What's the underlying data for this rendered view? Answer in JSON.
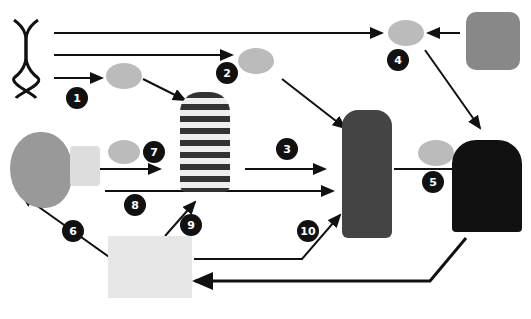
{
  "diagram": {
    "title": "",
    "nodes": [
      {
        "id": "dna",
        "label": "genes (DNA)",
        "icon": "dna-icon"
      },
      {
        "id": "brain1",
        "icon": "brain-icon"
      },
      {
        "id": "brain2",
        "icon": "brain-icon"
      },
      {
        "id": "brain4",
        "icon": "brain-icon"
      },
      {
        "id": "brain5",
        "icon": "brain-icon"
      },
      {
        "id": "brain7",
        "icon": "brain-icon"
      },
      {
        "id": "peers",
        "label": "social interaction",
        "icon": "people-icon"
      },
      {
        "id": "child",
        "label": "child",
        "icon": "child-icon"
      },
      {
        "id": "adolescent",
        "label": "adolescent drinking",
        "icon": "adolescent-icon"
      },
      {
        "id": "adult",
        "label": "adult with alcohol problem",
        "icon": "adult-drinking-icon"
      },
      {
        "id": "fetus",
        "label": "prenatal alcohol exposure",
        "icon": "fetus-icon"
      },
      {
        "id": "home",
        "label": "family environment with alcohol",
        "icon": "house-icon"
      }
    ],
    "badges": [
      "1",
      "2",
      "3",
      "4",
      "5",
      "6",
      "7",
      "8",
      "9",
      "10"
    ]
  }
}
